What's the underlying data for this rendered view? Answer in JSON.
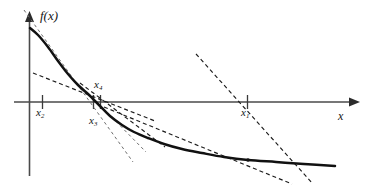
{
  "figure": {
    "title": "",
    "background_color": "#ffffff",
    "width": 375,
    "height": 185,
    "axis_label_y": "f(x)",
    "axis_label_x": "x",
    "curve_color": "#111111",
    "axis_color": "#4a4a4a",
    "tangent_color": "#1c1c1c"
  },
  "labels": {
    "fx": "f(x)",
    "x": "x",
    "x1_base": "x",
    "x1_sub": "1",
    "x2_base": "x",
    "x2_sub": "2",
    "x3_base": "x",
    "x3_sub": "3",
    "x4_base": "x",
    "x4_sub": "4"
  },
  "chart_data": {
    "type": "line",
    "title": "",
    "xlabel": "x",
    "ylabel": "f(x)",
    "grid": false,
    "legend": null,
    "annotations": [
      "x₁",
      "x₂",
      "x₃",
      "x₄"
    ],
    "axes": {
      "origin_px": [
        29,
        102
      ],
      "x_axis_from_px": [
        14,
        102
      ],
      "x_axis_to_px": [
        352,
        102
      ],
      "y_axis_from_px": [
        29,
        176
      ],
      "y_axis_to_px": [
        29,
        14
      ]
    },
    "tick_marks": [
      {
        "label": "x2",
        "x_px": 42,
        "label_side": "below"
      },
      {
        "label": "x3",
        "x_px": 93,
        "label_side": "below"
      },
      {
        "label": "x4",
        "x_px": 100,
        "label_side": "above"
      },
      {
        "label": "x1",
        "x_px": 247,
        "label_side": "below"
      }
    ],
    "curve_points_px": [
      [
        30,
        28
      ],
      [
        38,
        35
      ],
      [
        48,
        47
      ],
      [
        58,
        61
      ],
      [
        68,
        74
      ],
      [
        78,
        85
      ],
      [
        88,
        94
      ],
      [
        93,
        99
      ],
      [
        100,
        106
      ],
      [
        110,
        116
      ],
      [
        122,
        125
      ],
      [
        134,
        132
      ],
      [
        148,
        138
      ],
      [
        164,
        144
      ],
      [
        182,
        149
      ],
      [
        202,
        153
      ],
      [
        224,
        157
      ],
      [
        248,
        160
      ],
      [
        276,
        162
      ],
      [
        304,
        164
      ],
      [
        335,
        166
      ]
    ],
    "root_marker_px": [
      248,
      160
    ],
    "tangent_lines_px": [
      {
        "name": "tangent-at-x1",
        "from": [
          196,
          55
        ],
        "to": [
          310,
          182
        ]
      },
      {
        "name": "tangent-at-x2",
        "from": [
          33,
          73
        ],
        "to": [
          150,
          119
        ]
      },
      {
        "name": "tangent-at-x3",
        "from": [
          80,
          84
        ],
        "to": [
          162,
          145
        ]
      },
      {
        "name": "tangent-at-x4",
        "from": [
          24,
          10
        ],
        "to": [
          130,
          158
        ]
      },
      {
        "name": "tangent-long-right",
        "from": [
          100,
          104
        ],
        "to": [
          286,
          186
        ]
      }
    ]
  }
}
